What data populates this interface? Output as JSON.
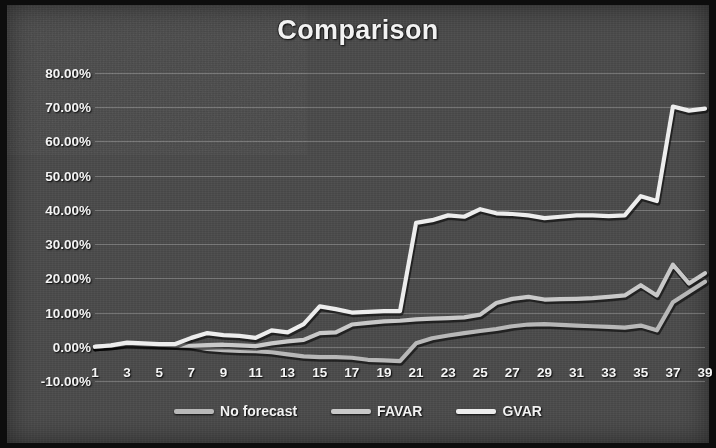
{
  "chart_data": {
    "type": "line",
    "title": "Comparison",
    "xlabel": "",
    "ylabel": "",
    "xlim": [
      1,
      39
    ],
    "ylim": [
      -10,
      80
    ],
    "y_tick_labels": [
      "80.00%",
      "70.00%",
      "60.00%",
      "50.00%",
      "40.00%",
      "30.00%",
      "20.00%",
      "10.00%",
      "0.00%",
      "-10.00%"
    ],
    "y_ticks": [
      80,
      70,
      60,
      50,
      40,
      30,
      20,
      10,
      0,
      -10
    ],
    "x_tick_labels": [
      "1",
      "3",
      "5",
      "7",
      "9",
      "11",
      "13",
      "15",
      "17",
      "19",
      "21",
      "23",
      "25",
      "27",
      "29",
      "31",
      "33",
      "35",
      "37",
      "39"
    ],
    "x_ticks": [
      1,
      3,
      5,
      7,
      9,
      11,
      13,
      15,
      17,
      19,
      21,
      23,
      25,
      27,
      29,
      31,
      33,
      35,
      37,
      39
    ],
    "x": [
      1,
      2,
      3,
      4,
      5,
      6,
      7,
      8,
      9,
      10,
      11,
      12,
      13,
      14,
      15,
      16,
      17,
      18,
      19,
      20,
      21,
      22,
      23,
      24,
      25,
      26,
      27,
      28,
      29,
      30,
      31,
      32,
      33,
      34,
      35,
      36,
      37,
      38,
      39
    ],
    "grid": "horizontal",
    "legend_position": "bottom",
    "units": "percent",
    "series": [
      {
        "name": "No forecast",
        "color": "#b8b8b8",
        "values": [
          0.0,
          0.3,
          0.8,
          0.6,
          0.5,
          0.4,
          0.2,
          -0.6,
          -1.0,
          -1.2,
          -1.3,
          -1.6,
          -2.2,
          -2.8,
          -3.0,
          -3.0,
          -3.2,
          -3.8,
          -4.0,
          -4.2,
          1.0,
          2.5,
          3.3,
          4.0,
          4.6,
          5.2,
          6.0,
          6.5,
          6.6,
          6.4,
          6.2,
          6.0,
          5.8,
          5.6,
          6.2,
          4.8,
          13.0,
          16.0,
          19.0
        ]
      },
      {
        "name": "FAVAR",
        "color": "#c9c9c9",
        "values": [
          0.0,
          0.3,
          1.0,
          0.8,
          0.6,
          0.4,
          0.3,
          0.5,
          0.6,
          0.4,
          0.2,
          1.0,
          1.6,
          2.0,
          4.0,
          4.2,
          6.5,
          7.0,
          7.4,
          7.6,
          8.0,
          8.2,
          8.4,
          8.6,
          9.4,
          12.8,
          14.0,
          14.6,
          13.8,
          13.9,
          14.0,
          14.2,
          14.6,
          15.0,
          18.0,
          15.0,
          24.0,
          18.5,
          21.5
        ]
      },
      {
        "name": "GVAR",
        "color": "#ededed",
        "values": [
          0.0,
          0.4,
          1.2,
          1.0,
          0.8,
          0.8,
          2.6,
          4.0,
          3.4,
          3.2,
          2.6,
          4.8,
          4.2,
          6.6,
          11.8,
          11.0,
          10.0,
          10.2,
          10.4,
          10.4,
          36.2,
          37.0,
          38.4,
          38.0,
          40.2,
          39.0,
          38.8,
          38.4,
          37.6,
          38.0,
          38.4,
          38.4,
          38.2,
          38.4,
          44.0,
          42.6,
          70.2,
          69.0,
          69.6
        ]
      }
    ]
  },
  "style": {
    "background": "#4a4a4a",
    "text_color": "#f2f2f2",
    "gridline_color": "#dcdcdc"
  }
}
